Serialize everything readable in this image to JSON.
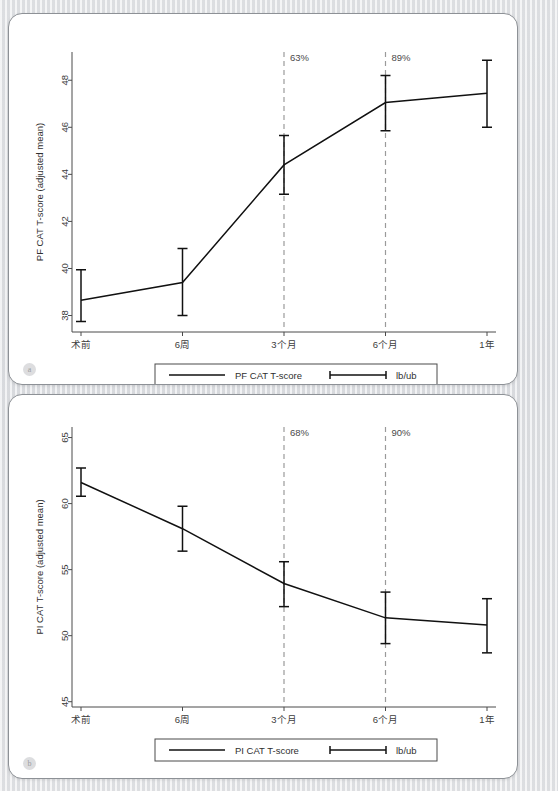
{
  "figure": {
    "background_color": "#e9eaec",
    "card_color": "#ffffff",
    "line_color": "#111111",
    "dashed_line_color": "#9a9a9a"
  },
  "panels": [
    {
      "badge": "a",
      "chart_data": {
        "type": "line",
        "title": "",
        "xlabel": "",
        "ylabel": "PF CAT T-score (adjusted mean)",
        "categories": [
          "术前",
          "6周",
          "3个月",
          "6个月",
          "1年"
        ],
        "series": [
          {
            "name": "PF CAT T-score",
            "values": [
              38.65,
              39.4,
              44.4,
              47.05,
              47.45
            ],
            "lb": [
              37.75,
              38.0,
              43.15,
              45.85,
              46.0
            ],
            "ub": [
              39.95,
              40.85,
              45.65,
              48.2,
              48.85
            ]
          }
        ],
        "ylim": [
          37.3,
          49.2
        ],
        "yticks": [
          38,
          40,
          42,
          44,
          46,
          48
        ],
        "grid": false,
        "legend_position": "bottom",
        "legend": [
          {
            "label": "PF CAT T-score",
            "marker": "line"
          },
          {
            "label": "lb/ub",
            "marker": "errorbar"
          }
        ],
        "annotations": [
          {
            "x": "3个月",
            "text": "63%"
          },
          {
            "x": "6个月",
            "text": "89%"
          }
        ]
      }
    },
    {
      "badge": "b",
      "chart_data": {
        "type": "line",
        "title": "",
        "xlabel": "",
        "ylabel": "PI CAT T-score (adjusted mean)",
        "categories": [
          "术前",
          "6周",
          "3个月",
          "6个月",
          "1年"
        ],
        "series": [
          {
            "name": "PI CAT T-score",
            "values": [
              61.6,
              58.1,
              53.95,
              51.35,
              50.8
            ],
            "lb": [
              60.55,
              56.4,
              52.2,
              49.4,
              48.7
            ],
            "ub": [
              62.7,
              59.8,
              55.6,
              53.3,
              52.8
            ]
          }
        ],
        "ylim": [
          44.6,
          65.8
        ],
        "yticks": [
          45,
          50,
          55,
          60,
          65
        ],
        "grid": false,
        "legend_position": "bottom",
        "legend": [
          {
            "label": "PI CAT T-score",
            "marker": "line"
          },
          {
            "label": "lb/ub",
            "marker": "errorbar"
          }
        ],
        "annotations": [
          {
            "x": "3个月",
            "text": "68%"
          },
          {
            "x": "6个月",
            "text": "90%"
          }
        ]
      }
    }
  ]
}
